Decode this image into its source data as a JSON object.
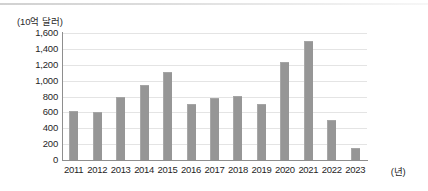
{
  "chart_data": {
    "type": "bar",
    "title": "",
    "subtitle": "",
    "ylabel": "(10억 달러)",
    "xlabel": "(년)",
    "categories": [
      "2011",
      "2012",
      "2013",
      "2014",
      "2015",
      "2016",
      "2017",
      "2018",
      "2019",
      "2020",
      "2021",
      "2022",
      "2023"
    ],
    "values": [
      615,
      610,
      790,
      940,
      1110,
      710,
      775,
      805,
      705,
      1230,
      1500,
      500,
      150
    ],
    "series": [
      {
        "name": "value",
        "values": [
          615,
          610,
          790,
          940,
          1110,
          710,
          775,
          805,
          705,
          1230,
          1500,
          500,
          150
        ]
      }
    ],
    "ylim": [
      0,
      1600
    ],
    "ytick_labels": [
      "1,600",
      "1,400",
      "1,200",
      "1,000",
      "800",
      "600",
      "400",
      "200",
      "0"
    ],
    "ytick_values": [
      1600,
      1400,
      1200,
      1000,
      800,
      600,
      400,
      200,
      0
    ],
    "grid": true,
    "legend": null,
    "bar_color": "#969696",
    "grid_color": "#e4e4e4",
    "axis_color": "#8e8e8e",
    "text_color": "#1f1f1f",
    "background": "#ffffff"
  }
}
